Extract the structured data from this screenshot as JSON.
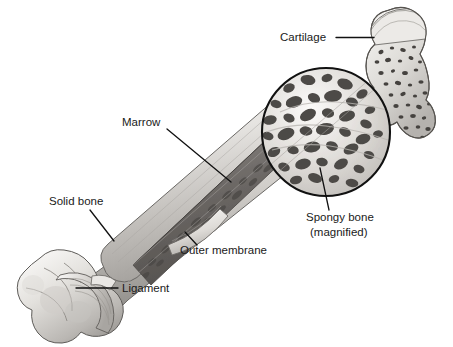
{
  "figure": {
    "background_color": "#ffffff",
    "width": 453,
    "height": 347,
    "style": "pencil-shaded anatomical illustration, grayscale"
  },
  "labels": [
    {
      "id": "cartilage",
      "text": "Cartilage",
      "text_x": 280,
      "text_y": 41,
      "anchor": "start",
      "leader": {
        "x1": 336,
        "y1": 37.5,
        "x2": 374,
        "y2": 37.5
      },
      "points_to": "cartilage cap on proximal epiphysis"
    },
    {
      "id": "marrow",
      "text": "Marrow",
      "text_x": 122,
      "text_y": 126,
      "anchor": "start",
      "leader": {
        "x1": 167,
        "y1": 129,
        "x2": 231,
        "y2": 182
      },
      "points_to": "marrow cavity inside cut-away shaft"
    },
    {
      "id": "solid-bone",
      "text": "Solid bone",
      "text_x": 49,
      "text_y": 205,
      "anchor": "start",
      "leader": {
        "x1": 90,
        "y1": 210,
        "x2": 114,
        "y2": 241
      },
      "points_to": "compact bone wall of the shaft"
    },
    {
      "id": "outer-membrane",
      "text": "Outer membrane",
      "text_x": 180,
      "text_y": 254,
      "anchor": "start",
      "leader": {
        "x1": 185,
        "y1": 232,
        "x2": 197,
        "y2": 245
      },
      "points_to": "periosteum flap peeled from shaft"
    },
    {
      "id": "ligament",
      "text": "Ligament",
      "text_x": 122,
      "text_y": 292,
      "anchor": "start",
      "leader": {
        "x1": 76,
        "y1": 288,
        "x2": 118,
        "y2": 288
      },
      "points_to": "ligament sheath at distal end"
    },
    {
      "id": "spongy-bone",
      "text": "Spongy bone",
      "text2": "(magnified)",
      "text_x": 306,
      "text_y": 221,
      "text2_x": 310,
      "text2_y": 236,
      "anchor": "start",
      "leader": {
        "x1": 320,
        "y1": 168,
        "x2": 329,
        "y2": 210
      },
      "points_to": "trabecular bone inside magnifier circle"
    }
  ],
  "magnifier": {
    "name": "magnified-spongy-bone-circle",
    "center_x": 326,
    "center_y": 132,
    "radius": 64,
    "outline_color": "#111111",
    "content": "spongy (trabecular) bone showing dark irregular pores and pale bony struts"
  },
  "anatomy": {
    "shaft": "diaphysis running diagonally from lower-left to upper-right",
    "distal_end": "condyles at lower left with ligament wrapping",
    "proximal_end": "epiphysis at upper right with cartilage cap and speckled spongy bone",
    "cutaway": "shaft opened lengthwise to expose dark marrow cavity",
    "colors": {
      "bone_light": "#f3f2f0",
      "bone_mid": "#c9c7c3",
      "bone_shadow": "#8e8c88",
      "marrow_dark": "#6e6a66",
      "outline": "#4a4845"
    }
  }
}
